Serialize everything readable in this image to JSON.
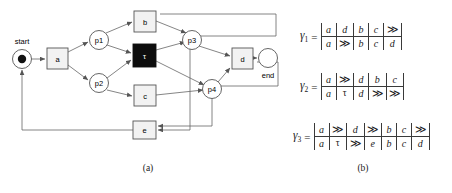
{
  "figure": {
    "panel_a": {
      "caption": "(a)",
      "start_label": "start",
      "end_label": "end",
      "places": [
        {
          "id": "start",
          "label": "",
          "cx": 22,
          "cy": 59,
          "r": 9.5,
          "token": true
        },
        {
          "id": "p1",
          "label": "p1",
          "cx": 99,
          "cy": 40,
          "r": 9.5,
          "token": false
        },
        {
          "id": "p2",
          "label": "p2",
          "cx": 99,
          "cy": 83,
          "r": 9.5,
          "token": false
        },
        {
          "id": "p3",
          "label": "p3",
          "cx": 192,
          "cy": 40,
          "r": 9.5,
          "token": false
        },
        {
          "id": "p4",
          "label": "p4",
          "cx": 212,
          "cy": 89,
          "r": 9.5,
          "token": false
        },
        {
          "id": "end",
          "label": "",
          "cx": 268,
          "cy": 58,
          "r": 9.5,
          "token": false
        }
      ],
      "transitions": [
        {
          "id": "a",
          "label": "a",
          "x": 47,
          "y": 48,
          "w": 21,
          "h": 21,
          "silent": false
        },
        {
          "id": "b",
          "label": "b",
          "x": 134,
          "y": 11,
          "w": 22,
          "h": 21,
          "silent": false
        },
        {
          "id": "tau",
          "label": "τ",
          "x": 133,
          "y": 44,
          "w": 23,
          "h": 23,
          "silent": true
        },
        {
          "id": "c",
          "label": "c",
          "x": 134,
          "y": 85,
          "w": 22,
          "h": 21,
          "silent": false
        },
        {
          "id": "d",
          "label": "d",
          "x": 232,
          "y": 48,
          "w": 21,
          "h": 21,
          "silent": false
        },
        {
          "id": "e",
          "label": "e",
          "x": 133,
          "y": 121,
          "w": 23,
          "h": 18,
          "silent": false
        }
      ]
    },
    "panel_b": {
      "caption": "(b)",
      "alignments": [
        {
          "name": "γ",
          "subscript": "1",
          "equals": "=",
          "top": [
            "a",
            "d",
            "b",
            "c",
            "≫"
          ],
          "bottom": [
            "a",
            "≫",
            "b",
            "c",
            "d"
          ]
        },
        {
          "name": "γ",
          "subscript": "2",
          "equals": "=",
          "top": [
            "a",
            "≫",
            "d",
            "b",
            "c"
          ],
          "bottom": [
            "a",
            "τ",
            "d",
            "≫",
            "≫"
          ]
        },
        {
          "name": "γ",
          "subscript": "3",
          "equals": "=",
          "top": [
            "a",
            "≫",
            "d",
            "≫",
            "b",
            "c",
            "≫"
          ],
          "bottom": [
            "a",
            "τ",
            "≫",
            "e",
            "b",
            "c",
            "d"
          ]
        }
      ]
    }
  }
}
